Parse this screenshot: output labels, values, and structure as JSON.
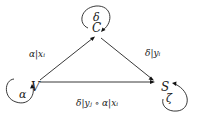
{
  "diagram": {
    "type": "state-transition",
    "nodes": [
      {
        "id": "C",
        "label": "C",
        "self_loop_label": "δ"
      },
      {
        "id": "V",
        "label": "V",
        "self_loop_label": "α"
      },
      {
        "id": "S",
        "label": "S",
        "self_loop_label": "ζ"
      }
    ],
    "edges": [
      {
        "from": "V",
        "to": "C",
        "label": "α|xᵢ"
      },
      {
        "from": "C",
        "to": "S",
        "label": "δ|yᵢ"
      },
      {
        "from": "V",
        "to": "S",
        "label": "δ|yⱼ ∘ α|xᵢ"
      }
    ]
  }
}
